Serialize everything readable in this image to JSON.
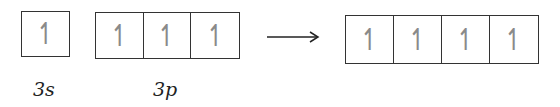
{
  "diagram": {
    "left": {
      "s_orbital": {
        "label": "3s",
        "electrons": [
          "↿"
        ]
      },
      "p_orbitals": {
        "label": "3p",
        "electrons": [
          "↿",
          "↿",
          "↿"
        ]
      }
    },
    "arrow": "→",
    "right": {
      "hybrid_orbitals": {
        "label": "",
        "electrons": [
          "↿",
          "↿",
          "↿",
          "↿"
        ]
      }
    },
    "colors": {
      "box_border": "#333333",
      "electron": "#8a8a8a"
    }
  }
}
